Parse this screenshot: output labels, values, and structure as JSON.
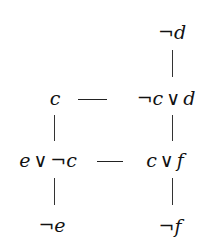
{
  "diagram": {
    "type": "resolution-graph",
    "nodes": {
      "not_d": {
        "neg": "¬",
        "var": "d",
        "label": "¬d"
      },
      "c": {
        "var": "c",
        "label": "c"
      },
      "not_c_or_d": {
        "neg": "¬",
        "var1": "c",
        "or": "∨",
        "var2": "d",
        "label": "¬c ∨ d"
      },
      "e_or_not_c": {
        "var1": "e",
        "or": "∨",
        "neg": "¬",
        "var2": "c",
        "label": "e ∨ ¬c"
      },
      "c_or_f": {
        "var1": "c",
        "or": "∨",
        "var2": "f",
        "label": "c ∨ f"
      },
      "not_e": {
        "neg": "¬",
        "var": "e",
        "label": "¬e"
      },
      "not_f": {
        "neg": "¬",
        "var": "f",
        "label": "¬f"
      }
    },
    "edges": [
      {
        "from": "not_d",
        "to": "not_c_or_d",
        "style": "vertical"
      },
      {
        "from": "c",
        "to": "not_c_or_d",
        "style": "horizontal"
      },
      {
        "from": "c",
        "to": "e_or_not_c",
        "style": "vertical"
      },
      {
        "from": "not_c_or_d",
        "to": "c_or_f",
        "style": "vertical"
      },
      {
        "from": "e_or_not_c",
        "to": "c_or_f",
        "style": "horizontal"
      },
      {
        "from": "e_or_not_c",
        "to": "not_e",
        "style": "vertical"
      },
      {
        "from": "c_or_f",
        "to": "not_f",
        "style": "vertical"
      }
    ]
  }
}
